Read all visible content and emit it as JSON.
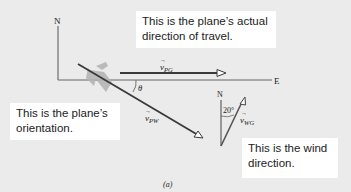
{
  "figure": {
    "caption": "(a)",
    "axes": {
      "north_label": "N",
      "east_label": "E"
    },
    "vectors": {
      "v_pg": {
        "symbol": "v",
        "subscript": "PG",
        "description": "plane velocity relative to ground"
      },
      "v_pw": {
        "symbol": "v",
        "subscript": "PW",
        "description": "plane velocity relative to wind"
      },
      "v_wg": {
        "symbol": "v",
        "subscript": "WG",
        "description": "wind velocity relative to ground"
      }
    },
    "angles": {
      "theta_label": "θ",
      "wind_angle_label": "20°"
    },
    "wind_axis": {
      "north_label": "N"
    },
    "callouts": {
      "top": {
        "line1": "This is the plane’s actual",
        "line2": "direction of travel."
      },
      "left": {
        "line1": "This is the plane’s",
        "line2": "orientation."
      },
      "right": {
        "line1": "This is the wind",
        "line2": "direction."
      }
    },
    "colors": {
      "background": "#ebebeb",
      "vector_stroke": "#3a3a3a",
      "axis_stroke": "#555555",
      "callout_bg": "#ffffff",
      "plane_fill": "#b5b5b5"
    }
  }
}
